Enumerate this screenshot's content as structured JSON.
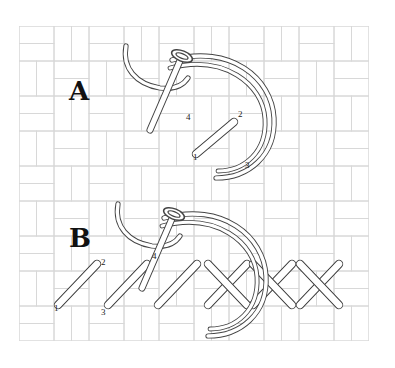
{
  "diagram": {
    "canvas": {
      "width": 395,
      "height": 368,
      "background": "#ffffff"
    },
    "fabric": {
      "name": "basketweave-grid",
      "line_color": "#d8d8d8",
      "brick_unit": 17.5,
      "origin_x": 19,
      "origin_y": 26,
      "cols": 20,
      "rows": 18
    },
    "ink": {
      "stroke": "#3b3b3b",
      "fill": "#ffffff",
      "thread_stroke": "#444444"
    },
    "panels": [
      {
        "id": "panel-a",
        "label": "A",
        "label_x": 69,
        "label_y": 100,
        "caption": "First half cross stitch with needle and thread",
        "points": [
          {
            "id": "1",
            "label": "1",
            "x": 193,
            "y": 160
          },
          {
            "id": "2",
            "label": "2",
            "x": 238,
            "y": 117
          },
          {
            "id": "3",
            "label": "3",
            "x": 245,
            "y": 168
          },
          {
            "id": "4",
            "label": "4",
            "x": 186,
            "y": 120
          }
        ]
      },
      {
        "id": "panel-b",
        "label": "B",
        "label_x": 69,
        "label_y": 247,
        "caption": "Row of diagonal stitches worked back into completed crosses",
        "points": [
          {
            "id": "1",
            "label": "1",
            "x": 54,
            "y": 311
          },
          {
            "id": "2",
            "label": "2",
            "x": 101,
            "y": 265
          },
          {
            "id": "3",
            "label": "3",
            "x": 101,
            "y": 315
          },
          {
            "id": "4",
            "label": "4",
            "x": 152,
            "y": 259
          }
        ]
      }
    ],
    "stitches_a": [
      {
        "name": "half-cross-stitch",
        "x1": 196,
        "y1": 154,
        "x2": 234,
        "y2": 122
      }
    ],
    "stitches_b": [
      {
        "name": "half-cross-stitch",
        "x1": 58,
        "y1": 305,
        "x2": 97,
        "y2": 264
      },
      {
        "name": "half-cross-stitch",
        "x1": 108,
        "y1": 305,
        "x2": 147,
        "y2": 264
      },
      {
        "name": "half-cross-stitch",
        "x1": 158,
        "y1": 305,
        "x2": 197,
        "y2": 264
      },
      {
        "name": "half-cross-stitch",
        "x1": 208,
        "y1": 305,
        "x2": 247,
        "y2": 264
      },
      {
        "name": "half-cross-stitch",
        "x1": 253,
        "y1": 305,
        "x2": 292,
        "y2": 264
      },
      {
        "name": "half-cross-stitch",
        "x1": 300,
        "y1": 305,
        "x2": 339,
        "y2": 264
      }
    ],
    "crosses_b": [
      {
        "name": "return-diagonal",
        "x1": 247,
        "y1": 305,
        "x2": 208,
        "y2": 264
      },
      {
        "name": "return-diagonal",
        "x1": 292,
        "y1": 305,
        "x2": 253,
        "y2": 264
      },
      {
        "name": "return-diagonal",
        "x1": 339,
        "y1": 305,
        "x2": 300,
        "y2": 264
      }
    ]
  }
}
